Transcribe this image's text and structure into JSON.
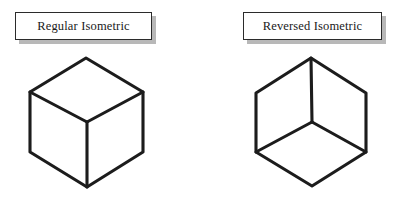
{
  "figure": {
    "background_color": "#ffffff",
    "line_color": "#1c1c1c",
    "shadow_color": "#b8b8b8"
  },
  "panels": [
    {
      "id": "regular",
      "label": "Regular Isometric",
      "cube": {
        "view": "from-above",
        "junction_type": "upright-Y",
        "description": "Standard isometric cube seen from above: top face visible, vertical interior edge runs downward from the centre junction to the bottom vertex.",
        "vertices": {
          "top": [
            86,
            58
          ],
          "left": [
            30,
            92
          ],
          "right": [
            143,
            92
          ],
          "center": [
            87,
            122
          ],
          "bottom_left": [
            30,
            152
          ],
          "bottom_right": [
            143,
            152
          ],
          "bottom": [
            87,
            187
          ]
        }
      }
    },
    {
      "id": "reversed",
      "label": "Reversed Isometric",
      "cube": {
        "view": "from-below",
        "junction_type": "inverted-Y",
        "description": "Reversed isometric cube seen from below: bottom face visible, vertical interior edge runs upward from the centre junction to the top vertex.",
        "vertices": {
          "top": [
            311,
            58
          ],
          "left": [
            256,
            93
          ],
          "right": [
            366,
            93
          ],
          "center": [
            312,
            122
          ],
          "bottom_left": [
            256,
            152
          ],
          "bottom_right": [
            366,
            152
          ],
          "bottom": [
            312,
            186
          ]
        }
      }
    }
  ]
}
